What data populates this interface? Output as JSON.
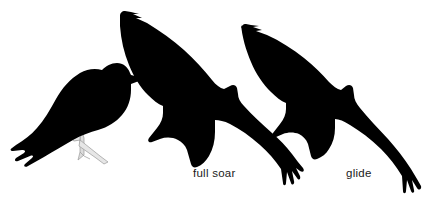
{
  "plate": {
    "background_color": "#ffffff",
    "silhouette_color": "#000000",
    "label_color": "#1a1a1a",
    "leg_color": "#d9d9d9",
    "width": 423,
    "height": 205
  },
  "figures": [
    {
      "id": "perched",
      "name": "perched-bird-silhouette",
      "label": "",
      "description": "perched raptor silhouette with long tail and gripping feet on a thin perch"
    },
    {
      "id": "full-soar",
      "name": "full-soar-bird-silhouette",
      "label": "full soar",
      "description": "raptor in full soar, wings raised in shallow dihedral with fingered primaries"
    },
    {
      "id": "glide",
      "name": "glide-bird-silhouette",
      "label": "glide",
      "description": "raptor in glide posture, wings swept back, clipped at right edge"
    }
  ],
  "labels": {
    "full_soar": "full soar",
    "glide": "glide"
  },
  "clipped_header": {
    "text": ""
  }
}
